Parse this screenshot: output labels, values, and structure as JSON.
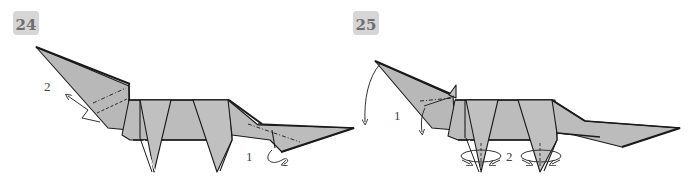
{
  "steps": [
    {
      "number": "24",
      "labels": {
        "head_action": "2",
        "tail_action": "1"
      }
    },
    {
      "number": "25",
      "labels": {
        "head_action": "1",
        "legs_action": "2"
      }
    }
  ],
  "colors": {
    "paper": "#b8b8b8",
    "paper_light": "#c4c4c4",
    "line": "#1a1a1a",
    "badge_bg": "#d6d6d6",
    "badge_text": "#6e6e6e"
  }
}
